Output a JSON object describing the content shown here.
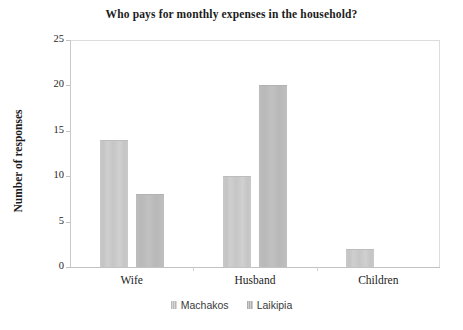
{
  "chart_data": {
    "type": "bar",
    "title": "Who pays for monthly expenses in the household?",
    "xlabel": "",
    "ylabel": "Number of responses",
    "categories": [
      "Wife",
      "Husband",
      "Children"
    ],
    "series": [
      {
        "name": "Machakos",
        "values": [
          14,
          10,
          2
        ],
        "color": "#c9c9c9"
      },
      {
        "name": "Laikipia",
        "values": [
          8,
          20,
          0
        ],
        "color": "#bcbcbc"
      }
    ],
    "ylim": [
      0,
      25
    ],
    "yticks": [
      0,
      5,
      10,
      15,
      20,
      25
    ],
    "ytick_labels": [
      "0",
      "5",
      "10",
      "15",
      "20",
      "25"
    ],
    "grid": false,
    "legend_position": "bottom-center",
    "plot_background": "#ffffff",
    "frame_color": "#dcdcdc"
  },
  "legend": {
    "items": [
      {
        "label": "Machakos"
      },
      {
        "label": "Laikipia"
      }
    ]
  }
}
